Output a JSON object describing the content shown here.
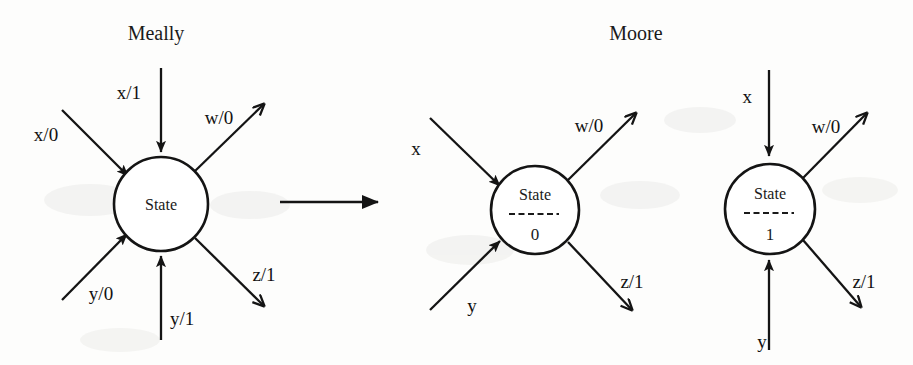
{
  "diagram": {
    "kind": "state-machine-conversion",
    "titles": {
      "left": "Meally",
      "right": "Moore"
    },
    "conversion_arrow": {
      "name": "converts-to-arrow",
      "direction": "left-to-right"
    },
    "machines": [
      {
        "id": "mealy-state",
        "type": "mealy",
        "title": "Meally",
        "node_label": "State",
        "output_value": null,
        "cx": 161,
        "cy": 204,
        "r": 47,
        "edges": [
          {
            "name": "mealy-in-top",
            "label": "x/1",
            "direction": "in",
            "angle": "top",
            "label_x": 141,
            "label_y": 99
          },
          {
            "name": "mealy-in-upper-left",
            "label": "x/0",
            "direction": "in",
            "angle": "upper-left",
            "label_x": 46,
            "label_y": 141
          },
          {
            "name": "mealy-in-lower-left",
            "label": "y/0",
            "direction": "in",
            "angle": "lower-left",
            "label_x": 86,
            "label_y": 300
          },
          {
            "name": "mealy-in-bottom",
            "label": "y/1",
            "direction": "in",
            "angle": "bottom",
            "label_x": 170,
            "label_y": 325
          },
          {
            "name": "mealy-out-upper-right",
            "label": "w/0",
            "direction": "out",
            "angle": "upper-right",
            "label_x": 219,
            "label_y": 124
          },
          {
            "name": "mealy-out-lower-right",
            "label": "z/1",
            "direction": "out",
            "angle": "lower-right",
            "label_x": 251,
            "label_y": 281
          }
        ]
      },
      {
        "id": "moore-state-0",
        "type": "moore",
        "title": "Moore",
        "node_label": "State",
        "output_value": "0",
        "cx": 535,
        "cy": 210,
        "r": 44,
        "edges": [
          {
            "name": "moore0-in-upper-left",
            "label": "x",
            "direction": "in",
            "angle": "upper-left",
            "label_x": 416,
            "label_y": 155
          },
          {
            "name": "moore0-in-lower-left",
            "label": "y",
            "direction": "in",
            "angle": "lower-left",
            "label_x": 468,
            "label_y": 310
          },
          {
            "name": "moore0-out-upper-right",
            "label": "w/0",
            "direction": "out",
            "angle": "upper-right",
            "label_x": 578,
            "label_y": 132
          },
          {
            "name": "moore0-out-lower-right",
            "label": "z/1",
            "direction": "out",
            "angle": "lower-right",
            "label_x": 622,
            "label_y": 288
          }
        ]
      },
      {
        "id": "moore-state-1",
        "type": "moore",
        "title": "Moore",
        "node_label": "State",
        "output_value": "1",
        "cx": 770,
        "cy": 209,
        "r": 45,
        "edges": [
          {
            "name": "moore1-in-top",
            "label": "x",
            "direction": "in",
            "angle": "top",
            "label_x": 745,
            "label_y": 103
          },
          {
            "name": "moore1-in-bottom",
            "label": "y",
            "direction": "in",
            "angle": "bottom",
            "label_x": 758,
            "label_y": 348
          },
          {
            "name": "moore1-out-upper-right",
            "label": "w/0",
            "direction": "out",
            "angle": "upper-right",
            "label_x": 813,
            "label_y": 133
          },
          {
            "name": "moore1-out-lower-right",
            "label": "z/1",
            "direction": "out",
            "angle": "lower-right",
            "label_x": 853,
            "label_y": 288
          }
        ]
      }
    ],
    "colors": {
      "ink": "#141414",
      "paper": "#fdfdfc"
    }
  }
}
